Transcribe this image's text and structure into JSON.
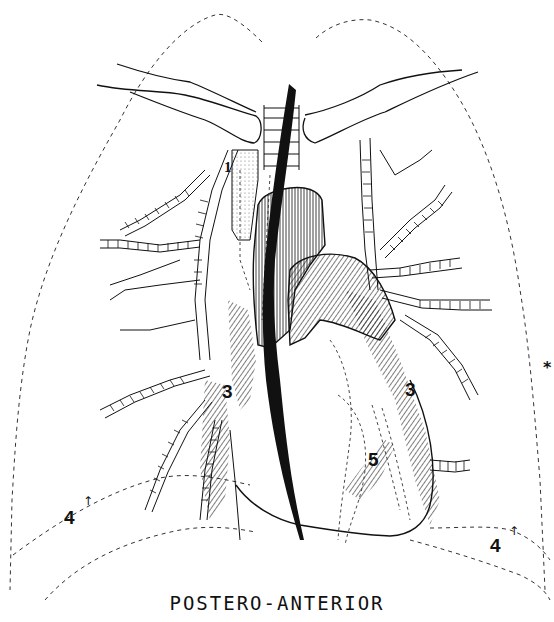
{
  "figure": {
    "caption": "POSTERO-ANTERIOR",
    "colors": {
      "ink": "#111111",
      "background": "#ffffff"
    }
  },
  "labels": [
    {
      "id": "1",
      "text": "1",
      "x": 224,
      "y": 168,
      "size": 15
    },
    {
      "id": "3-left",
      "text": "3",
      "x": 222,
      "y": 380,
      "size": 19
    },
    {
      "id": "3-right",
      "text": "3",
      "x": 405,
      "y": 377,
      "size": 19
    },
    {
      "id": "4-left",
      "text": "4",
      "x": 64,
      "y": 508,
      "size": 19
    },
    {
      "id": "4-right",
      "text": "4",
      "x": 490,
      "y": 536,
      "size": 19
    },
    {
      "id": "5",
      "text": "5",
      "x": 368,
      "y": 448,
      "size": 19
    }
  ],
  "marker": {
    "text": "*",
    "x": 546,
    "y": 360
  },
  "structures": [
    {
      "name": "lung-outline-right",
      "style": "dashed"
    },
    {
      "name": "lung-outline-left",
      "style": "dashed"
    },
    {
      "name": "clavicle-right",
      "style": "solid"
    },
    {
      "name": "clavicle-left",
      "style": "solid"
    },
    {
      "name": "trachea",
      "style": "ringed"
    },
    {
      "name": "catheter",
      "style": "solid-black"
    },
    {
      "name": "aorta-ascending",
      "style": "hatched"
    },
    {
      "name": "pulmonary-artery",
      "style": "hatched"
    },
    {
      "name": "heart-outline",
      "style": "solid"
    },
    {
      "name": "bronchial-tree-right",
      "style": "ringed"
    },
    {
      "name": "bronchial-tree-left",
      "style": "ringed"
    },
    {
      "name": "diaphragm-dome-right",
      "style": "dashed"
    },
    {
      "name": "diaphragm-dome-left",
      "style": "dashed"
    }
  ]
}
